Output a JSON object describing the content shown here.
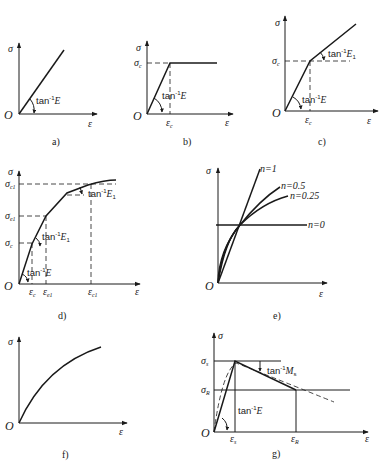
{
  "panels": [
    {
      "id": "a",
      "caption": "a)",
      "y_label": "σ",
      "x_label": "ε",
      "origin": "O",
      "annotations": [
        "tan⁻¹E"
      ],
      "description": "Linear elastic"
    },
    {
      "id": "b",
      "caption": "b)",
      "y_label": "σ",
      "x_label": "ε",
      "origin": "O",
      "y_ticks": [
        "σc"
      ],
      "x_ticks": [
        "εc"
      ],
      "annotations": [
        "tan⁻¹E"
      ],
      "description": "Elastic-perfectly plastic"
    },
    {
      "id": "c",
      "caption": "c)",
      "y_label": "σ",
      "x_label": "ε",
      "origin": "O",
      "y_ticks": [
        "σc"
      ],
      "x_ticks": [
        "εc"
      ],
      "annotations": [
        "tan⁻¹E",
        "tan⁻¹E1"
      ],
      "description": "Bilinear hardening"
    },
    {
      "id": "d",
      "caption": "d)",
      "y_label": "σ",
      "x_label": "ε",
      "origin": "O",
      "y_ticks": [
        "σc",
        "σe1",
        "σc1"
      ],
      "x_ticks": [
        "εc",
        "εe1",
        "εc1"
      ],
      "annotations": [
        "tan⁻¹E",
        "tan⁻¹E1",
        "tan⁻¹E1"
      ],
      "description": "Multilinear approximation of nonlinear curve"
    },
    {
      "id": "e",
      "caption": "e)",
      "y_label": "σ",
      "x_label": "ε",
      "origin": "O",
      "curves": [
        "n=1",
        "n=0.5",
        "n=0.25",
        "n=0"
      ],
      "description": "Power-law hardening family"
    },
    {
      "id": "f",
      "caption": "f)",
      "y_label": "σ",
      "x_label": "ε",
      "origin": "O",
      "description": "Nonlinear hardening curve"
    },
    {
      "id": "g",
      "caption": "g)",
      "y_label": "σ",
      "x_label": "ε",
      "origin": "O",
      "y_ticks": [
        "σs",
        "σR"
      ],
      "x_ticks": [
        "εs",
        "εR"
      ],
      "annotations": [
        "tan⁻¹E",
        "tan⁻¹Ms"
      ],
      "description": "Softening model"
    }
  ],
  "text": {
    "sigma": "σ",
    "eps": "ε",
    "O": "O",
    "tan": "tan",
    "inv": "-1",
    "E": "E",
    "E1": "E",
    "one": "1",
    "M": "M",
    "s": "s",
    "c": "c",
    "e1": "e1",
    "c1": "c1",
    "R": "R",
    "n1": "n=1",
    "n05": "n=0.5",
    "n025": "n=0.25",
    "n0": "n=0",
    "cap_a": "a)",
    "cap_b": "b)",
    "cap_c": "c)",
    "cap_d": "d)",
    "cap_e": "e)",
    "cap_f": "f)",
    "cap_g": "g)"
  }
}
